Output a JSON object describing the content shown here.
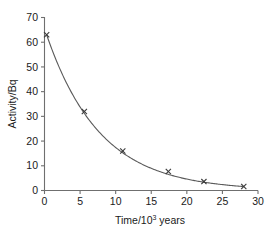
{
  "chart_data": {
    "type": "line",
    "title": "",
    "subtitle": "",
    "xlabel": "Time/10",
    "xlabel_exponent": "3",
    "xlabel_suffix": " years",
    "xlabel_full": "Time/10³ years",
    "ylabel": "Activity/Bq",
    "xlim": [
      0,
      30
    ],
    "ylim": [
      0,
      70
    ],
    "xticks": [
      0,
      5,
      10,
      15,
      20,
      25,
      30
    ],
    "xtick_labels": [
      "0",
      "5",
      "10",
      "15",
      "20",
      "25",
      "30"
    ],
    "yticks": [
      0,
      10,
      20,
      30,
      40,
      50,
      60,
      70
    ],
    "ytick_labels": [
      "0",
      "10",
      "20",
      "30",
      "40",
      "50",
      "60",
      "70"
    ],
    "grid": false,
    "legend": false,
    "legend_position": "none",
    "marker_style": "x",
    "line_color": "#5a5a5a",
    "marker_color": "#3a3a3a",
    "axis_color": "#6f6f6f",
    "background_color": "#ffffff",
    "x": [
      0.3,
      5.6,
      11.0,
      17.4,
      22.4,
      28.0
    ],
    "values": [
      63,
      32,
      16,
      7.7,
      3.6,
      1.6
    ],
    "series": [
      {
        "name": "Activity",
        "x": [
          0.3,
          5.6,
          11.0,
          17.4,
          22.4,
          28.0
        ],
        "values": [
          63,
          32,
          16,
          7.7,
          3.6,
          1.6
        ]
      }
    ],
    "points": [
      {
        "x": 0.3,
        "y": 63
      },
      {
        "x": 5.6,
        "y": 32
      },
      {
        "x": 11.0,
        "y": 16
      },
      {
        "x": 17.4,
        "y": 7.7
      },
      {
        "x": 22.4,
        "y": 3.6
      },
      {
        "x": 28.0,
        "y": 1.6
      }
    ],
    "annotations": []
  }
}
